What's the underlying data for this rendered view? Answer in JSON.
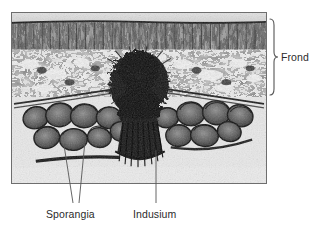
{
  "figure": {
    "kind": "light-micrograph-cross-section",
    "background_color": "#ffffff",
    "label_color": "#2b2b2b",
    "leader_color": "#555555"
  },
  "photo": {
    "name": "fern-sorus-micrograph",
    "border_color": "#6e6e6e",
    "x": 11,
    "y": 12,
    "width": 256,
    "height": 172,
    "regions": [
      {
        "name": "upper-epidermis",
        "tone": "light-gray-band"
      },
      {
        "name": "palisade-mesophyll",
        "tone": "dark-columnar-cells"
      },
      {
        "name": "spongy-mesophyll",
        "tone": "mottled-dark-light"
      },
      {
        "name": "receptacle-placenta",
        "tone": "dense-black-mass"
      },
      {
        "name": "sporangia-cluster-left",
        "tone": "ringed-oval-bodies"
      },
      {
        "name": "sporangia-cluster-right",
        "tone": "ringed-oval-bodies"
      },
      {
        "name": "indusium-flap",
        "tone": "dark-striated-fringe"
      }
    ]
  },
  "labels": [
    {
      "id": "frond",
      "text": "Frond",
      "marker": "brace",
      "brace": {
        "x": 270,
        "top": 19,
        "bottom": 95,
        "tip_x": 278,
        "mid_y": 57
      }
    },
    {
      "id": "sporangia",
      "text": "Sporangia",
      "marker": "leader-lines",
      "leaders": [
        {
          "x1": 64,
          "y1": 145,
          "x2": 73,
          "y2": 203
        },
        {
          "x1": 85,
          "y1": 141,
          "x2": 79,
          "y2": 203
        }
      ]
    },
    {
      "id": "indusium",
      "text": "Indusium",
      "marker": "leader-line",
      "leaders": [
        {
          "x1": 156,
          "y1": 150,
          "x2": 156,
          "y2": 203
        }
      ]
    }
  ]
}
